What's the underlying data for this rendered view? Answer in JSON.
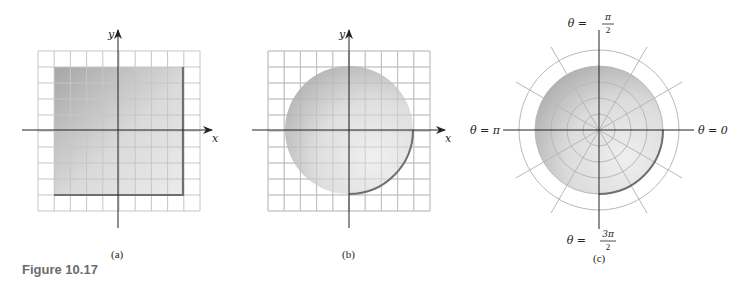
{
  "figure": {
    "label": "Figure 10.17"
  },
  "panels": [
    {
      "id": "a",
      "caption": "(a)",
      "x_axis_label": "x",
      "y_axis_label": "y",
      "grid": {
        "columns": 10,
        "rows": 10
      },
      "region": "square",
      "region_extent": {
        "x_min": -4,
        "x_max": 4,
        "y_min": -4,
        "y_max": 4
      }
    },
    {
      "id": "b",
      "caption": "(b)",
      "x_axis_label": "x",
      "y_axis_label": "y",
      "grid": {
        "columns": 10,
        "rows": 10
      },
      "region": "disk",
      "region_extent": {
        "radius": 4
      }
    },
    {
      "id": "c",
      "caption": "(c)",
      "polar_grid": {
        "rings": 5,
        "shaded_ring": 4,
        "spoke_spacing_deg": 30
      },
      "region": "disk",
      "angle_labels": {
        "top": {
          "prefix": "θ =",
          "num": "π",
          "den": "2"
        },
        "bottom": {
          "prefix": "θ =",
          "num": "3π",
          "den": "2"
        },
        "left": "θ = π",
        "right": "θ = 0"
      }
    }
  ],
  "colors": {
    "shade_dark": "#a6a6a6",
    "shade_light": "#ececec",
    "grid_line": "#c8c8c8",
    "axis": "#222222",
    "edge": "#6f6f6f"
  }
}
